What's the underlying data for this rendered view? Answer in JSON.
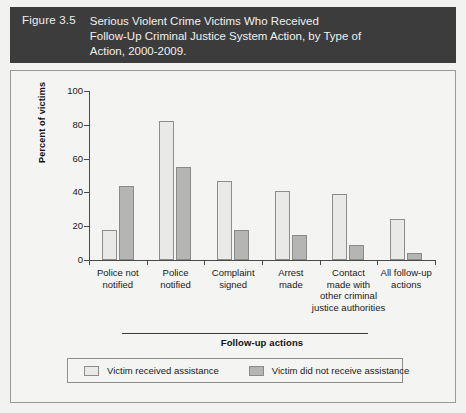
{
  "figure": {
    "number_label": "Figure 3.5",
    "title_lines": [
      "Serious Violent Crime Victims Who Received",
      "Follow-Up Criminal Justice System Action, by Type of",
      "Action, 2000-2009."
    ],
    "banner_color": "#3c3c3c",
    "banner_text_color": "#f0f0f0"
  },
  "chart_data": {
    "type": "bar",
    "title": "Serious Violent Crime Victims Who Received Follow-Up Criminal Justice System Action, by Type of Action, 2000-2009.",
    "xlabel": "Follow-up actions",
    "ylabel": "Percent of victims",
    "ylim": [
      0,
      100
    ],
    "yticks": [
      0,
      20,
      40,
      60,
      80,
      100
    ],
    "grid": false,
    "legend_position": "bottom",
    "categories": [
      "Police not notified",
      "Police notified",
      "Complaint signed",
      "Arrest made",
      "Contact made with other criminal justice authorities",
      "All follow-up actions"
    ],
    "category_label_lines": [
      [
        "Police not",
        "notified"
      ],
      [
        "Police",
        "notified"
      ],
      [
        "Complaint",
        "signed"
      ],
      [
        "Arrest",
        "made"
      ],
      [
        "Contact",
        "made with",
        "other criminal",
        "justice authorities"
      ],
      [
        "All follow-up",
        "actions"
      ]
    ],
    "series": [
      {
        "name": "Victim received assistance",
        "color": "#e9e9e7",
        "values": [
          18,
          82,
          47,
          41,
          39,
          24
        ]
      },
      {
        "name": "Victim did not receive assistance",
        "color": "#b5b5b3",
        "values": [
          44,
          55,
          18,
          15,
          9,
          4
        ]
      }
    ]
  },
  "legend": {
    "items": [
      {
        "label": "Victim received assistance"
      },
      {
        "label": "Victim did not receive assistance"
      }
    ]
  }
}
